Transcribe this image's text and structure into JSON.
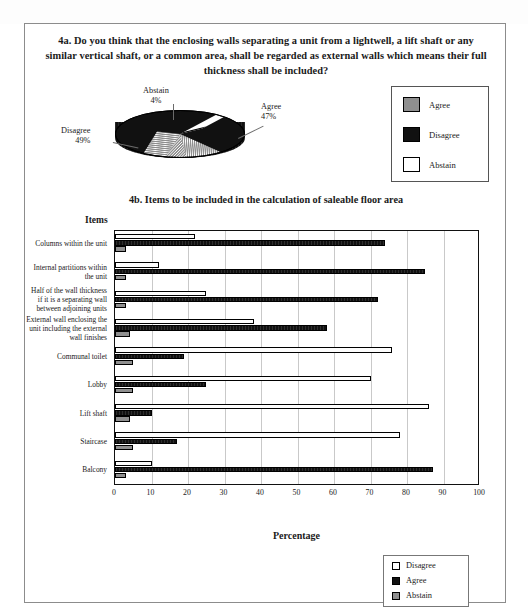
{
  "page": {
    "ghost_header": "",
    "question_4a": "4a. Do you think that the enclosing walls separating a unit from a lightwell, a lift shaft or any similar vertical shaft, or a common area, shall be regarded as external walls which means their full thickness shall be included?",
    "question_4b": "4b. Items to be included in the calculation of saleable floor area",
    "items_axis_label": "Items",
    "percentage_axis_label": "Percentage"
  },
  "pie_legend": {
    "items": [
      {
        "label": "Agree",
        "swatch": "agree-swatch",
        "color": "#8f8f8f"
      },
      {
        "label": "Disagree",
        "swatch": "disagree-swatch",
        "color": "#111111"
      },
      {
        "label": "Abstain",
        "swatch": "abstain-swatch",
        "color": "#ffffff"
      }
    ]
  },
  "bar_legend": {
    "items": [
      {
        "label": "Disagree",
        "swatch": "disagree-swatch",
        "color": "#ffffff"
      },
      {
        "label": "Agree",
        "swatch": "agree-swatch",
        "color": "#111111"
      },
      {
        "label": "Abstain",
        "swatch": "abstain-swatch",
        "color": "#8f8f8f"
      }
    ]
  },
  "chart_data": [
    {
      "type": "pie",
      "title": "4a. Do you think that the enclosing walls separating a unit from a lightwell, a lift shaft or any similar vertical shaft, or a common area, shall be regarded as external walls which means their full thickness shall be included?",
      "labels": [
        "Agree",
        "Disagree",
        "Abstain"
      ],
      "values": [
        47,
        49,
        4
      ],
      "unit": "%",
      "annotations": [
        {
          "name": "Abstain",
          "text": "Abstain",
          "value_text": "4%"
        },
        {
          "name": "Agree",
          "text": "Agree",
          "value_text": "47%"
        },
        {
          "name": "Disagree",
          "text": "Disagree",
          "value_text": "49%"
        }
      ],
      "legend_position": "right",
      "three_d": true
    },
    {
      "type": "bar",
      "orientation": "horizontal",
      "title": "4b. Items to be included in the calculation of saleable floor area",
      "xlabel": "Percentage",
      "ylabel": "Items",
      "xlim": [
        0,
        100
      ],
      "xticks": [
        0,
        10,
        20,
        30,
        40,
        50,
        60,
        70,
        80,
        90,
        100
      ],
      "grid": true,
      "categories": [
        "Columns within the unit",
        "Internal partitions within the unit",
        "Half of the wall thickness if it is a separating wall between adjoining units",
        "External wall enclosing the unit including the external wall finishes",
        "Communal toilet",
        "Lobby",
        "Lift shaft",
        "Staircase",
        "Balcony"
      ],
      "series": [
        {
          "name": "Disagree",
          "color": "#ffffff",
          "values": [
            22,
            12,
            25,
            38,
            76,
            70,
            86,
            78,
            10
          ]
        },
        {
          "name": "Agree",
          "color": "#111111",
          "values": [
            74,
            85,
            72,
            58,
            19,
            25,
            10,
            17,
            87
          ]
        },
        {
          "name": "Abstain",
          "color": "#8f8f8f",
          "values": [
            3,
            3,
            3,
            4,
            5,
            5,
            4,
            5,
            3
          ]
        }
      ],
      "legend_position": "bottom-right"
    }
  ]
}
